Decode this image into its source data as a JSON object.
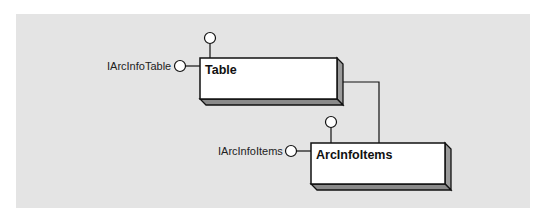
{
  "diagram": {
    "type": "object-model",
    "background_color": "#e4e4e4",
    "classes": [
      {
        "id": "table",
        "name": "Table",
        "interfaces": [
          {
            "name": "IArcInfoTable",
            "position": "left"
          },
          {
            "name": "",
            "position": "top"
          }
        ]
      },
      {
        "id": "arcinfoitems",
        "name": "ArcInfoItems",
        "interfaces": [
          {
            "name": "IArcInfoItems",
            "position": "left"
          },
          {
            "name": "",
            "position": "top"
          }
        ]
      }
    ],
    "relationships": [
      {
        "from": "Table",
        "to": "ArcInfoItems",
        "type": "association"
      }
    ]
  }
}
